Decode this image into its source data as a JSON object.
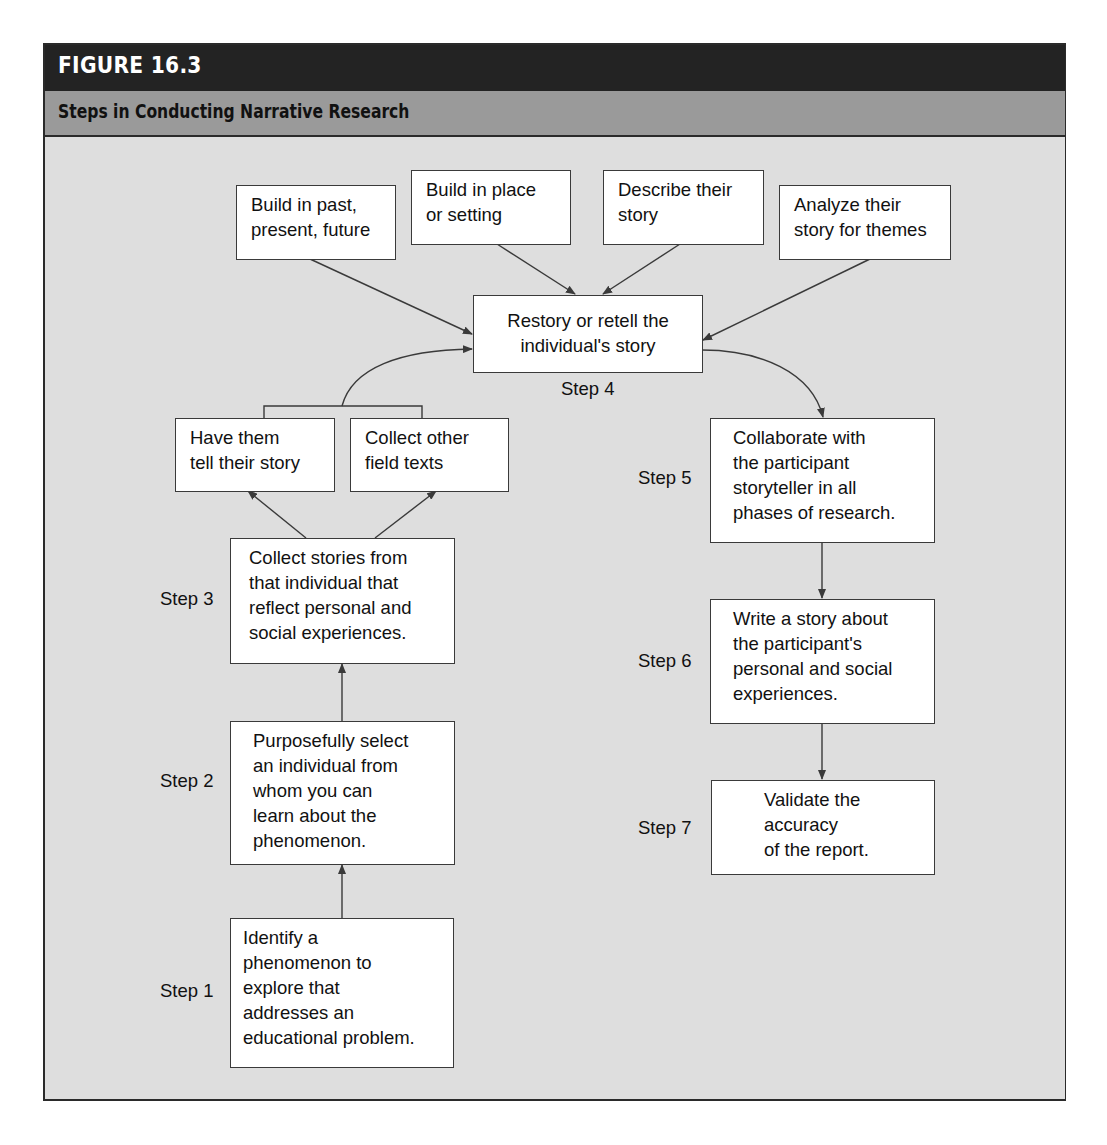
{
  "figure": {
    "number_label": "FIGURE 16.3",
    "title": "Steps in Conducting Narrative Research",
    "colors": {
      "header_bg": "#232323",
      "subtitle_bg": "#9a9a9a",
      "panel_bg": "#dedede",
      "box_bg": "#ffffff",
      "line": "#3a3a3a"
    }
  },
  "restory_inputs": [
    {
      "id": "past",
      "text": "Build in past,\npresent, future"
    },
    {
      "id": "place",
      "text": "Build in place\nor setting"
    },
    {
      "id": "describe",
      "text": "Describe their\nstory"
    },
    {
      "id": "analyze",
      "text": "Analyze their\nstory for themes"
    }
  ],
  "story_sources": [
    {
      "id": "tell",
      "text": "Have them\ntell their story"
    },
    {
      "id": "field",
      "text": "Collect other\nfield texts"
    }
  ],
  "steps": [
    {
      "label": "Step 1",
      "text": "Identify a\nphenomenon to\nexplore that\naddresses an\neducational problem."
    },
    {
      "label": "Step 2",
      "text": "Purposefully select\nan individual from\nwhom you can\nlearn about the\nphenomenon."
    },
    {
      "label": "Step 3",
      "text": "Collect stories from\nthat individual that\nreflect personal and\nsocial experiences."
    },
    {
      "label": "Step 4",
      "text": "Restory or retell the\nindividual's story"
    },
    {
      "label": "Step 5",
      "text": "Collaborate with\nthe participant\nstoryteller in all\nphases of research."
    },
    {
      "label": "Step 6",
      "text": "Write a story about\nthe participant's\npersonal and social\nexperiences."
    },
    {
      "label": "Step 7",
      "text": "Validate the\naccuracy\nof the report."
    }
  ]
}
